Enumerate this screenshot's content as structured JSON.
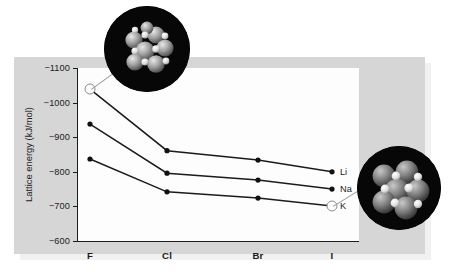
{
  "chart_data": {
    "type": "line",
    "title": "",
    "xlabel": "",
    "ylabel": "Lattice energy (kJ/mol)",
    "categories": [
      "F",
      "Cl",
      "Br",
      "I"
    ],
    "ylim": [
      -1100,
      -600
    ],
    "yticks": [
      -1100,
      -1000,
      -900,
      -800,
      -700,
      -600
    ],
    "ytick_labels": [
      "−1100",
      "−1000",
      "−900",
      "−800",
      "−700",
      "−600"
    ],
    "grid": false,
    "legend_position": "right-inline",
    "series": [
      {
        "name": "Li",
        "values": [
          -1039,
          -861,
          -834,
          -800
        ]
      },
      {
        "name": "Na",
        "values": [
          -938,
          -796,
          -776,
          -750
        ]
      },
      {
        "name": "K",
        "values": [
          -837,
          -742,
          -724,
          -701
        ]
      }
    ],
    "annotations": [
      {
        "name": "lif-crystal-callout",
        "label": "",
        "anchor_series": "Li",
        "anchor_category": "F"
      },
      {
        "name": "ki-crystal-callout",
        "label": "",
        "anchor_series": "K",
        "anchor_category": "I"
      }
    ]
  },
  "colors": {
    "panel": "#d6d6d6",
    "plot_background": "#fdfdfd",
    "axis": "#1b1b1b",
    "series_line": "#1b1b1b",
    "marker": "#111111",
    "callout_background": "#070707",
    "leader_line": "#9a9a9a",
    "page_background": "#ffffff"
  }
}
